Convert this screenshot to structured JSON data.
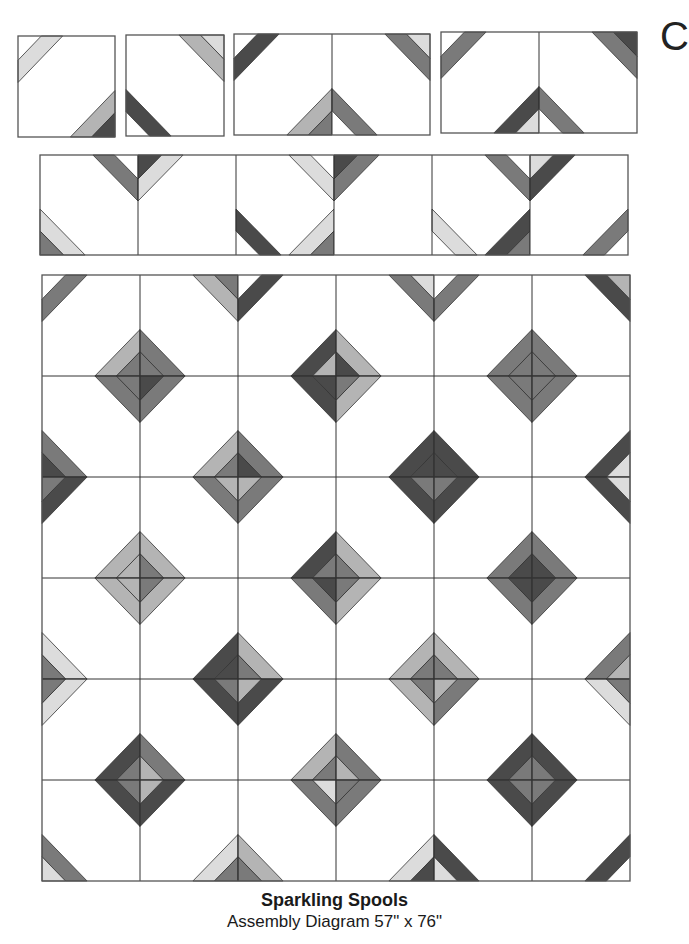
{
  "caption": {
    "title": "Sparkling Spools",
    "subtitle": "Assembly Diagram 57\" x 76\""
  },
  "edge_glyph": "C",
  "colors": {
    "D": "#4a4a4a",
    "M": "#7a7a7a",
    "L": "#b4b4b4",
    "X": "#dcdcdc",
    "line": "#333333",
    "bg": "#ffffff"
  },
  "geometry": {
    "tri_frac": 0.24,
    "strip_frac": 0.22
  },
  "panels": [
    {
      "name": "step-single-block-a",
      "x": 18,
      "y": 36,
      "cols": 1,
      "rows": 1,
      "cw": 97,
      "ch": 101,
      "blocks": [
        {
          "tl": [
            "X",
            null
          ],
          "br": [
            "L",
            "D"
          ]
        }
      ]
    },
    {
      "name": "step-single-block-b",
      "x": 126,
      "y": 35,
      "cols": 1,
      "rows": 1,
      "cw": 98,
      "ch": 101,
      "blocks": [
        {
          "tr": [
            "L",
            "X"
          ],
          "bl": [
            "D",
            null
          ]
        }
      ]
    },
    {
      "name": "step-pair-a",
      "x": 234,
      "y": 34,
      "cols": 2,
      "rows": 1,
      "cw": 98,
      "ch": 101,
      "blocks": [
        {
          "tl": [
            "D",
            null
          ],
          "br": [
            "L",
            "M"
          ]
        },
        {
          "tr": [
            "M",
            "X"
          ],
          "bl": [
            "M",
            null
          ]
        }
      ]
    },
    {
      "name": "step-pair-b",
      "x": 441,
      "y": 32,
      "cols": 2,
      "rows": 1,
      "cw": 98,
      "ch": 101,
      "blocks": [
        {
          "tl": [
            "M",
            null
          ],
          "br": [
            "D",
            "X"
          ]
        },
        {
          "tr": [
            "M",
            "D"
          ],
          "bl": [
            "M",
            null
          ]
        }
      ]
    },
    {
      "name": "row-assembly",
      "x": 40,
      "y": 155,
      "cols": 6,
      "rows": 1,
      "cw": 98,
      "ch": 100,
      "blocks": [
        {
          "tr": [
            "M",
            null
          ],
          "bl": [
            "X",
            "M"
          ]
        },
        {
          "tl": [
            "X",
            "D"
          ]
        },
        {
          "tr": [
            "X",
            null
          ],
          "bl": [
            "D",
            null
          ],
          "br": [
            "X",
            "M"
          ]
        },
        {
          "tl": [
            "M",
            "D"
          ]
        },
        {
          "tr": [
            "M",
            null
          ],
          "bl": [
            "X",
            null
          ],
          "br": [
            "D",
            "M"
          ]
        },
        {
          "tl": [
            "D",
            "X"
          ],
          "br": [
            "M",
            null
          ]
        }
      ]
    },
    {
      "name": "quilt-grid",
      "x": 42,
      "y": 275,
      "cols": 6,
      "rows": 6,
      "cw": 98,
      "ch": 101,
      "blocks": [
        {
          "tl": [
            "M",
            null
          ],
          "br": [
            "L",
            "M"
          ]
        },
        {
          "tr": [
            "L",
            "M"
          ],
          "bl": [
            "M",
            "M"
          ]
        },
        {
          "tl": [
            "D",
            null
          ],
          "br": [
            "D",
            "L"
          ]
        },
        {
          "tr": [
            "M",
            "X"
          ],
          "bl": [
            "L",
            "D"
          ]
        },
        {
          "tl": [
            "M",
            null
          ],
          "br": [
            "M",
            "M"
          ]
        },
        {
          "tr": [
            "D",
            "L"
          ],
          "bl": [
            "M",
            "M"
          ]
        },
        {
          "tr": [
            "M",
            "M"
          ],
          "bl": [
            "M",
            "D"
          ]
        },
        {
          "tl": [
            "M",
            "D"
          ],
          "br": [
            "L",
            "M"
          ]
        },
        {
          "tr": [
            "D",
            "D"
          ],
          "bl": [
            "M",
            "D"
          ]
        },
        {
          "tl": [
            "L",
            "M"
          ],
          "br": [
            "D",
            "D"
          ]
        },
        {
          "tr": [
            "M",
            "M"
          ],
          "bl": [
            "D",
            "D"
          ]
        },
        {
          "tl": [
            "M",
            "M"
          ],
          "br": [
            "D",
            "X"
          ]
        },
        {
          "tl": [
            "D",
            "M"
          ],
          "br": [
            "L",
            "L"
          ]
        },
        {
          "tr": [
            "M",
            "L"
          ],
          "bl": [
            "L",
            "M"
          ]
        },
        {
          "tl": [
            "M",
            "L"
          ],
          "br": [
            "D",
            "M"
          ]
        },
        {
          "tr": [
            "D",
            "M"
          ],
          "bl": [
            "L",
            "M"
          ]
        },
        {
          "tl": [
            "D",
            "M"
          ],
          "br": [
            "M",
            "D"
          ]
        },
        {
          "tr": [
            "D",
            "X"
          ],
          "bl": [
            "M",
            "D"
          ]
        },
        {
          "tr": [
            "L",
            "L"
          ],
          "bl": [
            "X",
            "M"
          ]
        },
        {
          "tl": [
            "L",
            "M"
          ],
          "br": [
            "D",
            "D"
          ]
        },
        {
          "tr": [
            "M",
            "D"
          ],
          "bl": [
            "L",
            "M"
          ]
        },
        {
          "tl": [
            "L",
            "M"
          ],
          "br": [
            "L",
            "M"
          ]
        },
        {
          "tr": [
            "M",
            "D"
          ],
          "bl": [
            "L",
            "M"
          ]
        },
        {
          "tl": [
            "M",
            "D"
          ],
          "br": [
            "M",
            "L"
          ]
        },
        {
          "tl": [
            "X",
            "M"
          ],
          "br": [
            "D",
            "M"
          ]
        },
        {
          "tr": [
            "D",
            "M"
          ],
          "bl": [
            "M",
            "L"
          ]
        },
        {
          "tl": [
            "D",
            "L"
          ],
          "br": [
            "L",
            "M"
          ]
        },
        {
          "tr": [
            "L",
            "M"
          ],
          "bl": [
            "M",
            "L"
          ]
        },
        {
          "tl": [
            "M",
            "L"
          ],
          "br": [
            "D",
            "M"
          ]
        },
        {
          "tr": [
            "X",
            "M"
          ],
          "bl": [
            "D",
            "M"
          ]
        },
        {
          "tr": [
            "D",
            "M"
          ],
          "bl": [
            "M",
            "X"
          ]
        },
        {
          "tl": [
            "D",
            "L"
          ],
          "br": [
            "X",
            "M"
          ]
        },
        {
          "tr": [
            "M",
            "X"
          ],
          "bl": [
            "L",
            "M"
          ]
        },
        {
          "tl": [
            "M",
            "M"
          ],
          "br": [
            "X",
            "D"
          ]
        },
        {
          "tr": [
            "D",
            "M"
          ],
          "bl": [
            "D",
            "X"
          ]
        },
        {
          "tl": [
            "D",
            "M"
          ],
          "br": [
            "D",
            null
          ]
        }
      ]
    }
  ]
}
